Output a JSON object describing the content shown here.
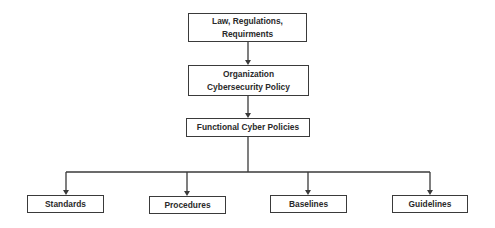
{
  "diagram": {
    "type": "hierarchy",
    "nodes": [
      {
        "id": "law",
        "label": "Law, Regulations,\nRequirments",
        "level": 0
      },
      {
        "id": "org_policy",
        "label": "Organization\nCybersecurity Policy",
        "level": 1
      },
      {
        "id": "functional",
        "label": "Functional Cyber Policies",
        "level": 2
      },
      {
        "id": "standards",
        "label": "Standards",
        "level": 3
      },
      {
        "id": "procedures",
        "label": "Procedures",
        "level": 3
      },
      {
        "id": "baselines",
        "label": "Baselines",
        "level": 3
      },
      {
        "id": "guidelines",
        "label": "Guidelines",
        "level": 3
      }
    ],
    "edges": [
      {
        "from": "law",
        "to": "org_policy"
      },
      {
        "from": "org_policy",
        "to": "functional"
      },
      {
        "from": "functional",
        "to": "standards"
      },
      {
        "from": "functional",
        "to": "procedures"
      },
      {
        "from": "functional",
        "to": "baselines"
      },
      {
        "from": "functional",
        "to": "guidelines"
      }
    ],
    "colors": {
      "line": "#3a3a3a",
      "box_border": "#3a3a3a",
      "text": "#2a2a2a",
      "background": "#ffffff"
    }
  }
}
